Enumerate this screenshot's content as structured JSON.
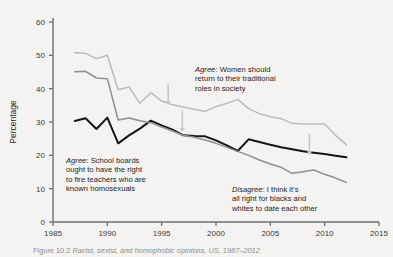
{
  "figure": {
    "caption_number": "Figure 10.2",
    "caption_text": "Racist, sexist, and homophobic opinions, US, 1987–2012"
  },
  "axes": {
    "ylabel": "Percentage",
    "xlabel": "",
    "yticks": [
      "0",
      "10",
      "20",
      "30",
      "40",
      "50",
      "60"
    ],
    "xticks": [
      "1985",
      "1990",
      "1995",
      "2000",
      "2005",
      "2010",
      "2015"
    ]
  },
  "annotations": {
    "women": {
      "lead": "Agree",
      "body": ": Women should\nreturn to their traditional\nroles in society"
    },
    "teachers": {
      "lead": "Agree",
      "body": ": School boards\nought to have the right\nto fire teachers who are\nknown homosexuals"
    },
    "interracial": {
      "lead": "Disagree",
      "body": ": I think it's\nall right for blacks and\nwhites to date each other"
    }
  },
  "colors": {
    "background": "#f4f3f1",
    "axis": "#6e6e6e",
    "series_women": "#b9bcbb",
    "series_teachers": "#151515",
    "series_interracial": "#8c8f8e",
    "arrow": "#c6c9c8"
  },
  "chart_data": {
    "type": "line",
    "title": "",
    "xlabel": "",
    "ylabel": "Percentage",
    "xlim": [
      1985,
      2015
    ],
    "ylim": [
      0,
      60
    ],
    "grid": false,
    "legend": "annotations-inline",
    "series": [
      {
        "name": "Agree: Women should return to their traditional roles in society",
        "color": "#b9bcbb",
        "x": [
          1987,
          1988,
          1989,
          1990,
          1991,
          1992,
          1993,
          1994,
          1995,
          1996,
          1997,
          1998,
          1999,
          2000,
          2001,
          2002,
          2003,
          2004,
          2005,
          2006,
          2007,
          2008,
          2009,
          2010,
          2011,
          2012
        ],
        "y": [
          50.8,
          50.6,
          49.0,
          50.0,
          39.7,
          40.5,
          35.6,
          38.8,
          36.3,
          35.2,
          34.5,
          33.8,
          33.2,
          34.6,
          35.6,
          36.8,
          34.0,
          32.5,
          31.6,
          31.0,
          29.6,
          29.4,
          29.4,
          29.4,
          26.0,
          23.2
        ]
      },
      {
        "name": "Agree: School boards ought to have the right to fire teachers who are known homosexuals",
        "color": "#151515",
        "x": [
          1987,
          1988,
          1989,
          1990,
          1991,
          1992,
          1993,
          1994,
          1995,
          1996,
          1997,
          1998,
          1999,
          2000,
          2001,
          2002,
          2003,
          2004,
          2005,
          2006,
          2007,
          2008,
          2009,
          2010,
          2011,
          2012
        ],
        "y": [
          30.3,
          31.1,
          27.9,
          31.3,
          23.6,
          26.0,
          28.0,
          30.4,
          29.0,
          27.7,
          26.0,
          25.8,
          25.7,
          24.5,
          23.0,
          21.3,
          24.8,
          24.0,
          23.2,
          22.4,
          21.8,
          21.2,
          20.8,
          20.4,
          19.9,
          19.4
        ]
      },
      {
        "name": "Disagree: I think it's all right for blacks and whites to date each other",
        "color": "#8c8f8e",
        "x": [
          1987,
          1988,
          1989,
          1990,
          1991,
          1992,
          1993,
          1994,
          1995,
          1996,
          1997,
          1998,
          1999,
          2000,
          2001,
          2002,
          2003,
          2004,
          2005,
          2006,
          2007,
          2008,
          2009,
          2010,
          2011,
          2012
        ],
        "y": [
          45.1,
          45.2,
          43.2,
          43.0,
          30.6,
          31.2,
          30.4,
          29.8,
          28.5,
          27.3,
          26.0,
          25.4,
          24.6,
          23.6,
          22.4,
          21.2,
          20.0,
          18.6,
          17.4,
          16.4,
          14.6,
          15.1,
          15.6,
          14.3,
          13.2,
          11.9
        ]
      }
    ],
    "annotation_markers": [
      {
        "name": "arrow-women",
        "x": 1995.6,
        "y_top": 41.5,
        "y_bottom": 35.0
      },
      {
        "name": "arrow-teachers",
        "x": 1996.9,
        "y_top": 33.5,
        "y_bottom": 27.0
      },
      {
        "name": "arrow-interracial",
        "x": 2008.6,
        "y_top": 26.5,
        "y_bottom": 20.0
      }
    ]
  }
}
